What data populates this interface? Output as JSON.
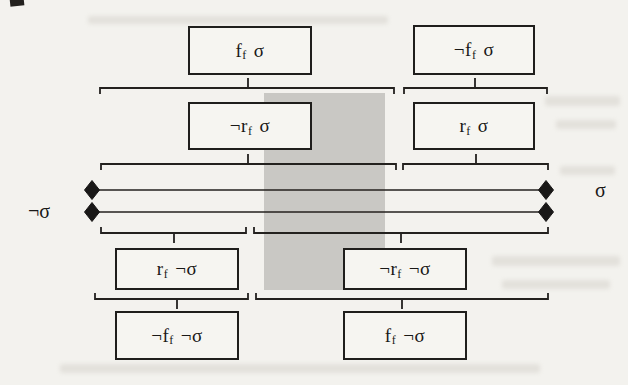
{
  "figure": {
    "type": "logic-interval-diagram",
    "colors": {
      "paper": "#f3f2ee",
      "ink": "#1f1e1c",
      "shaded_band": "#c9c8c4"
    },
    "axis": {
      "left_label": "¬σ",
      "right_label": "σ"
    },
    "boxes": [
      {
        "name": "ff-sigma",
        "pre": "f",
        "sub": "f",
        "arg": "σ"
      },
      {
        "name": "not-ff-sigma",
        "pre": "¬f",
        "sub": "f",
        "arg": "σ"
      },
      {
        "name": "not-rf-sigma",
        "pre": "¬r",
        "sub": "f",
        "arg": "σ"
      },
      {
        "name": "rf-sigma",
        "pre": "r",
        "sub": "f",
        "arg": "σ"
      },
      {
        "name": "rf-not-sigma",
        "pre": "r",
        "sub": "f",
        "arg": "¬σ"
      },
      {
        "name": "not-rf-not-sigma",
        "pre": "¬r",
        "sub": "f",
        "arg": "¬σ"
      },
      {
        "name": "not-ff-not-sigma",
        "pre": "¬f",
        "sub": "f",
        "arg": "¬σ"
      },
      {
        "name": "ff-not-sigma",
        "pre": "f",
        "sub": "f",
        "arg": "¬σ"
      }
    ]
  }
}
